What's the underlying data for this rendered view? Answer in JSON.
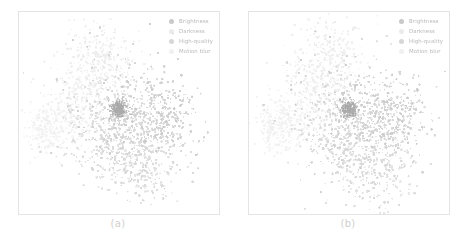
{
  "figure": {
    "panels": [
      {
        "caption": "(a)"
      },
      {
        "caption": "(b)"
      }
    ]
  },
  "legend": {
    "items": [
      {
        "label": "Brightness",
        "color": "#c9c9c9"
      },
      {
        "label": "Darkness",
        "color": "#ebebeb"
      },
      {
        "label": "High-quality",
        "color": "#d6d6d6"
      },
      {
        "label": "Motion blur",
        "color": "#f0f0f0"
      }
    ]
  },
  "chart_data": [
    {
      "type": "scatter",
      "title": "",
      "subtitle": "(a)",
      "xlabel": "",
      "ylabel": "",
      "xlim": [
        0,
        100
      ],
      "ylim": [
        0,
        100
      ],
      "grid": false,
      "axis_ticks": false,
      "legend_position": "top-right",
      "series": [
        {
          "name": "Brightness",
          "color": "#c9c9c9",
          "n_points": 620,
          "cluster_centers": [
            [
              57,
              45
            ],
            [
              74,
              48
            ],
            [
              50,
              52
            ]
          ],
          "spread": [
            18,
            14,
            26
          ],
          "description": "Mid-gray points forming the dense central and right-of-center lobes"
        },
        {
          "name": "Darkness",
          "color": "#ebebeb",
          "n_points": 430,
          "cluster_centers": [
            [
              41,
              78
            ],
            [
              35,
              64
            ]
          ],
          "spread": [
            15,
            16
          ],
          "description": "Very light points forming the upper-left arm of the manifold"
        },
        {
          "name": "High-quality",
          "color": "#d6d6d6",
          "n_points": 540,
          "cluster_centers": [
            [
              52,
              30
            ],
            [
              64,
              22
            ],
            [
              45,
              40
            ]
          ],
          "spread": [
            17,
            14,
            20
          ],
          "description": "Light-gray points forming the lower spray of the manifold"
        },
        {
          "name": "Motion blur",
          "color": "#f0f0f0",
          "n_points": 360,
          "cluster_centers": [
            [
              13,
              42
            ],
            [
              24,
              46
            ]
          ],
          "spread": [
            9,
            13
          ],
          "description": "Palest points forming the far-left narrow tail"
        }
      ],
      "dense_core": {
        "x": 50,
        "y": 52,
        "note": "dark compact knot near plot center"
      }
    },
    {
      "type": "scatter",
      "title": "",
      "subtitle": "(b)",
      "xlabel": "",
      "ylabel": "",
      "xlim": [
        0,
        100
      ],
      "ylim": [
        0,
        100
      ],
      "grid": false,
      "axis_ticks": false,
      "legend_position": "top-right",
      "series": [
        {
          "name": "Brightness",
          "color": "#c9c9c9",
          "n_points": 620,
          "cluster_centers": [
            [
              57,
              45
            ],
            [
              74,
              48
            ],
            [
              50,
              52
            ]
          ],
          "spread": [
            18,
            14,
            26
          ],
          "description": "Mid-gray points forming the dense central and right-of-center lobes"
        },
        {
          "name": "Darkness",
          "color": "#ebebeb",
          "n_points": 430,
          "cluster_centers": [
            [
              41,
              78
            ],
            [
              35,
              64
            ]
          ],
          "spread": [
            15,
            16
          ],
          "description": "Very light points forming the upper-left arm of the manifold"
        },
        {
          "name": "High-quality",
          "color": "#d6d6d6",
          "n_points": 540,
          "cluster_centers": [
            [
              52,
              30
            ],
            [
              64,
              22
            ],
            [
              45,
              40
            ]
          ],
          "spread": [
            17,
            14,
            20
          ],
          "description": "Light-gray points forming the lower spray of the manifold"
        },
        {
          "name": "Motion blur",
          "color": "#f0f0f0",
          "n_points": 360,
          "cluster_centers": [
            [
              13,
              42
            ],
            [
              24,
              46
            ]
          ],
          "spread": [
            9,
            13
          ],
          "description": "Palest points forming the far-left narrow tail"
        }
      ],
      "dense_core": {
        "x": 50,
        "y": 52,
        "note": "dark compact knot near plot center"
      }
    }
  ]
}
